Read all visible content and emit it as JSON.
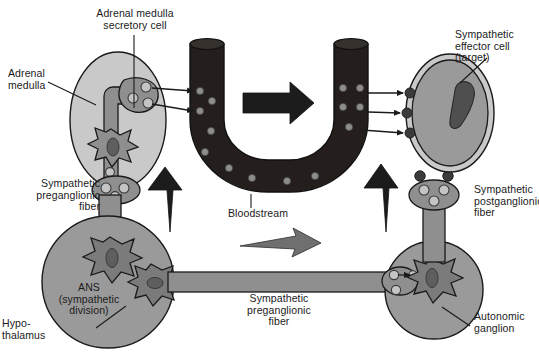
{
  "figure": {
    "background_color": "#ffffff",
    "palette": {
      "outline": "#1a1a1a",
      "text": "#1a1a1a",
      "organ_light_gray": "#c9c9c9",
      "cell_medium_gray": "#9a9a9a",
      "neuron_dark_gray": "#7b7b7b",
      "vessel_black": "#241f1c",
      "hormone_dot_gray": "#8d8d8d",
      "nucleus_dark": "#5e5e5e",
      "arrow_black": "#1c1c1c",
      "arrow_gray": "#6f6f6f"
    }
  },
  "labels": {
    "adrenal_medulla_secretory_cell": "Adrenal medulla\nsecretory cell",
    "adrenal_medulla": "Adrenal\nmedulla",
    "sympathetic_effector_cell": "Sympathetic\neffector cell\n(target)",
    "sympathetic_preganglionic_fiber_left": "Sympathetic\npreganglionic\nfiber",
    "bloodstream": "Bloodstream",
    "sympathetic_postganglionic_fiber": "Sympathetic\npostganglionic\nfiber",
    "ans_sympathetic_division": "ANS\n(sympathetic\ndivision)",
    "hypothalamus": "Hypo-\nthalamus",
    "sympathetic_preganglionic_fiber_bottom": "Sympathetic\npreganglionic\nfiber",
    "autonomic_ganglion": "Autonomic\nganglion"
  },
  "structures": [
    {
      "name": "adrenal-medulla",
      "shape": "ellipse",
      "fill": "#c9c9c9",
      "cx": 118,
      "cy": 120,
      "rx": 48,
      "ry": 68
    },
    {
      "name": "adrenal-medulla-secretory-cell",
      "shape": "irregular-cell",
      "fill": "#8f8f8f",
      "vesicles": 3
    },
    {
      "name": "bloodstream-vessel",
      "shape": "u-tube",
      "fill": "#241f1c",
      "hormone_dots": 14
    },
    {
      "name": "sympathetic-effector-cell",
      "shape": "ellipse",
      "fill": "#9a9a9a",
      "membrane_fill": "#c9c9c9",
      "cx": 450,
      "cy": 113,
      "rx": 44,
      "ry": 59
    },
    {
      "name": "ans-sympathetic-division",
      "shape": "circle",
      "fill": "#9a9a9a",
      "cx": 108,
      "cy": 282,
      "r": 66
    },
    {
      "name": "autonomic-ganglion",
      "shape": "circle",
      "fill": "#9a9a9a",
      "cx": 434,
      "cy": 290,
      "r": 49
    }
  ],
  "flow_arrows": [
    {
      "name": "hormone-release-arrow-upper",
      "direction": "right",
      "style": "thin-line-arrow",
      "from": "adrenal-medulla-secretory-cell",
      "to": "bloodstream-vessel"
    },
    {
      "name": "hormone-release-arrow-lower",
      "direction": "right",
      "style": "thin-line-arrow",
      "from": "adrenal-medulla-secretory-cell",
      "to": "bloodstream-vessel"
    },
    {
      "name": "bloodstream-flow-arrow",
      "direction": "right",
      "style": "block-arrow",
      "color": "#1c1c1c"
    },
    {
      "name": "hormone-to-target-arrow-1",
      "direction": "right",
      "style": "thin-line-arrow",
      "from": "bloodstream-vessel",
      "to": "sympathetic-effector-cell"
    },
    {
      "name": "hormone-to-target-arrow-2",
      "direction": "right",
      "style": "thin-line-arrow",
      "from": "bloodstream-vessel",
      "to": "sympathetic-effector-cell"
    },
    {
      "name": "hormone-to-target-arrow-3",
      "direction": "right",
      "style": "thin-line-arrow",
      "from": "bloodstream-vessel",
      "to": "sympathetic-effector-cell"
    },
    {
      "name": "impulse-arrow-left",
      "direction": "up",
      "style": "tapered-arrow",
      "color": "#1c1c1c"
    },
    {
      "name": "impulse-arrow-right",
      "direction": "up",
      "style": "tapered-arrow",
      "color": "#1c1c1c"
    },
    {
      "name": "nerve-impulse-arrow",
      "direction": "right",
      "style": "tapered-arrow",
      "color": "#6f6f6f"
    }
  ]
}
